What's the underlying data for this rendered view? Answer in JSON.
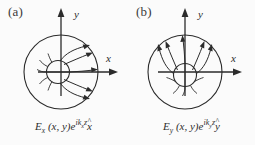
{
  "figure": {
    "background_color": "#fbfbfb",
    "stroke_color": "#2b2b2b",
    "width": 255,
    "height": 145
  },
  "panels": [
    {
      "id": "panel-a",
      "label": "(a)",
      "axes": {
        "x_label": "x",
        "y_label": "y"
      },
      "field_direction": "horizontal-outward-right",
      "caption": {
        "field_symbol": "E",
        "field_subscript": "x",
        "arguments": "(x, y)",
        "exponential_base": "e",
        "exponential_i": "i",
        "exponential_k": "k",
        "exponential_k_subscript": "x",
        "exponential_z": "z",
        "unit_vector": "x",
        "unit_vector_hat": "^",
        "full_text": "Ex (x, y)e^{ikx z} x̂"
      }
    },
    {
      "id": "panel-b",
      "label": "(b)",
      "axes": {
        "x_label": "x",
        "y_label": "y"
      },
      "field_direction": "vertical-outward-up",
      "caption": {
        "field_symbol": "E",
        "field_subscript": "y",
        "arguments": "(x, y)",
        "exponential_base": "e",
        "exponential_i": "i",
        "exponential_k": "k",
        "exponential_k_subscript": "y",
        "exponential_z": "z",
        "unit_vector": "y",
        "unit_vector_hat": "^",
        "full_text": "Ey (x, y)e^{iky z} ŷ"
      }
    }
  ]
}
